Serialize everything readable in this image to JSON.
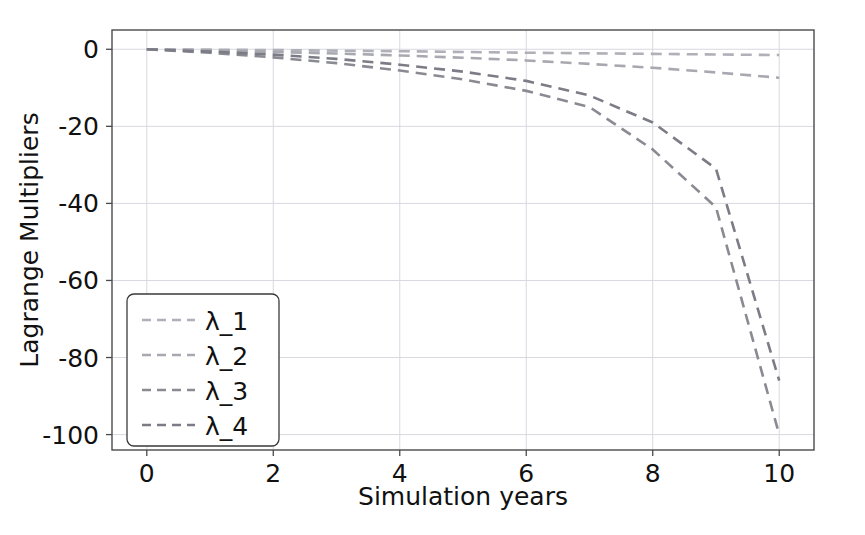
{
  "chart_data": {
    "type": "line",
    "title": "",
    "xlabel": "Simulation years",
    "ylabel": "Lagrange Multipliers",
    "xlim": [
      -0.55,
      10.55
    ],
    "ylim": [
      -104,
      5
    ],
    "xticks": [
      0,
      2,
      4,
      6,
      8,
      10
    ],
    "xticklabels": [
      "0",
      "2",
      "4",
      "6",
      "8",
      "10"
    ],
    "yticks": [
      0,
      -20,
      -40,
      -60,
      -80,
      -100
    ],
    "yticklabels": [
      "0",
      "-20",
      "-40",
      "-60",
      "-80",
      "-100"
    ],
    "grid": true,
    "grid_color": "#d8d8e0",
    "legend_position": "lower left",
    "linestyle": "dashed",
    "x": [
      0,
      1,
      2,
      3,
      4,
      5,
      6,
      7,
      8,
      9,
      10
    ],
    "series": [
      {
        "name": "λ_1",
        "color": "#b0b0b8",
        "values": [
          0.0,
          -0.1,
          -0.2,
          -0.35,
          -0.5,
          -0.7,
          -0.9,
          -1.05,
          -1.2,
          -1.35,
          -1.5
        ]
      },
      {
        "name": "λ_2",
        "color": "#a8a8b0",
        "values": [
          0.0,
          -0.3,
          -0.7,
          -1.1,
          -1.6,
          -2.2,
          -2.9,
          -3.8,
          -4.8,
          -6.0,
          -7.4
        ]
      },
      {
        "name": "λ_3",
        "color": "#8a8a92",
        "values": [
          0.0,
          -0.9,
          -2.1,
          -3.6,
          -5.5,
          -7.8,
          -10.8,
          -15.0,
          -26.0,
          -41.0,
          -100.0
        ]
      },
      {
        "name": "λ_4",
        "color": "#7c7c86",
        "values": [
          0.0,
          -0.6,
          -1.4,
          -2.5,
          -4.0,
          -5.8,
          -8.2,
          -12.0,
          -19.0,
          -31.0,
          -86.0
        ]
      }
    ]
  },
  "legend": {
    "entries": [
      {
        "label": "λ_1"
      },
      {
        "label": "λ_2"
      },
      {
        "label": "λ_3"
      },
      {
        "label": "λ_4"
      }
    ]
  },
  "axes": {
    "x_title": "Simulation years",
    "y_title": "Lagrange Multipliers",
    "x_tick_labels": [
      "0",
      "2",
      "4",
      "6",
      "8",
      "10"
    ],
    "y_tick_labels": [
      "0",
      "-20",
      "-40",
      "-60",
      "-80",
      "-100"
    ]
  },
  "style": {
    "background": "#ffffff",
    "axis_color": "#4a4a4a",
    "text_color": "#111111",
    "grid_color": "#d8d8e0"
  }
}
